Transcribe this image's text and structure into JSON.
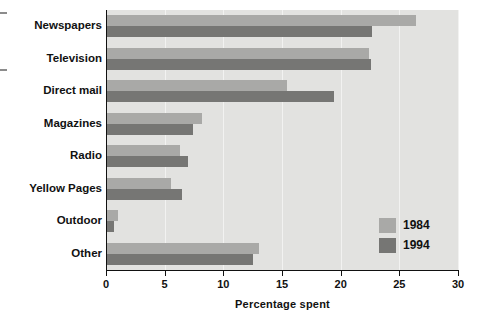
{
  "chart_data": {
    "type": "bar",
    "orientation": "horizontal",
    "title": "",
    "xlabel": "Percentage spent",
    "ylabel": "",
    "xlim": [
      0,
      30
    ],
    "xticks": [
      0,
      5,
      10,
      15,
      20,
      25,
      30
    ],
    "xtick_labels": [
      "0",
      "5",
      "10",
      "15",
      "20",
      "25",
      "30"
    ],
    "grid": true,
    "grid_axis": "x",
    "legend_position": "bottom-right",
    "categories": [
      "Newspapers",
      "Television",
      "Direct mail",
      "Magazines",
      "Radio",
      "Yellow Pages",
      "Outdoor",
      "Other"
    ],
    "series": [
      {
        "name": "1984",
        "color": "#a9a9a7",
        "values": [
          26.4,
          22.4,
          15.4,
          8.2,
          6.3,
          5.5,
          1.0,
          13.0
        ]
      },
      {
        "name": "1994",
        "color": "#767674",
        "values": [
          22.7,
          22.6,
          19.4,
          7.4,
          7.0,
          6.5,
          0.7,
          12.5
        ]
      }
    ]
  },
  "legend": {
    "entries": [
      {
        "label": "1984",
        "swatch": "legend-swatch-1984"
      },
      {
        "label": "1994",
        "swatch": "legend-swatch-1994"
      }
    ]
  },
  "axis": {
    "x_title": "Percentage spent"
  }
}
